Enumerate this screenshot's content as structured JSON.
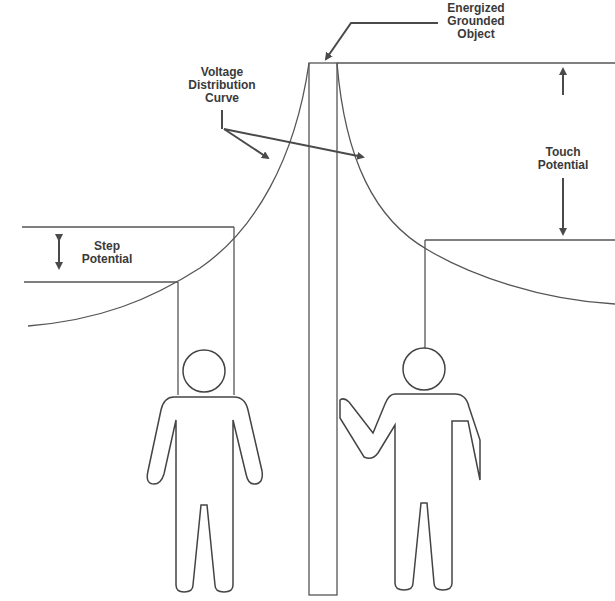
{
  "diagram": {
    "labels": {
      "object": "Energized\nGrounded\nObject",
      "curve": "Voltage\nDistribution\nCurve",
      "step": "Step\nPotential",
      "touch": "Touch\nPotential"
    },
    "elements": [
      "energized-grounded-object",
      "voltage-distribution-curve",
      "step-potential-person",
      "touch-potential-person"
    ],
    "colors": {
      "stroke": "#4a4a4a",
      "text": "#3a3a3a",
      "background": "#ffffff"
    }
  }
}
